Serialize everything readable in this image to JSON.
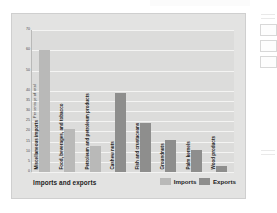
{
  "chart_data": {
    "type": "bar",
    "title": "",
    "xlabel": "Imports and exports",
    "ylabel": "Percentage of total",
    "ylim": [
      0,
      70
    ],
    "grid": true,
    "legend_position": "bottom-right",
    "yticks": [
      0,
      5,
      10,
      15,
      20,
      25,
      30,
      35,
      40,
      50,
      60,
      70
    ],
    "ytick_labels": [
      "0",
      "5",
      "10",
      "15",
      "20",
      "25",
      "30",
      "35",
      "40",
      "50",
      "60",
      "70"
    ],
    "categories": [
      "Miscellaneous imports",
      "Food, beverages, and tobacco",
      "Petroleum and petroleum products",
      "Cashew nuts",
      "Fish and crustaceans",
      "Groundnuts",
      "Palm kernels",
      "Wood products"
    ],
    "bars": [
      {
        "label": "Miscellaneous imports",
        "value": 60,
        "series": "Imports"
      },
      {
        "label": "Food, beverages, and tobacco",
        "value": 21,
        "series": "Imports"
      },
      {
        "label": "Petroleum and petroleum products",
        "value": 13,
        "series": "Imports"
      },
      {
        "label": "Cashew nuts",
        "value": 39,
        "series": "Exports"
      },
      {
        "label": "Fish and crustaceans",
        "value": 24,
        "series": "Exports"
      },
      {
        "label": "Groundnuts",
        "value": 16,
        "series": "Exports"
      },
      {
        "label": "Palm kernels",
        "value": 11,
        "series": "Exports"
      },
      {
        "label": "Wood products",
        "value": 3,
        "series": "Exports"
      }
    ],
    "series": [
      {
        "name": "Imports",
        "color": "#b9b9b8"
      },
      {
        "name": "Exports",
        "color": "#8e8e8d"
      }
    ]
  },
  "legend": {
    "imports_label": "Imports",
    "exports_label": "Exports"
  },
  "colors": {
    "imports": "#b9b9b8",
    "exports": "#8e8e8d",
    "panel": "#e3e3e2",
    "plot": "#dcdcdb",
    "gridline": "#f4f4f3"
  }
}
